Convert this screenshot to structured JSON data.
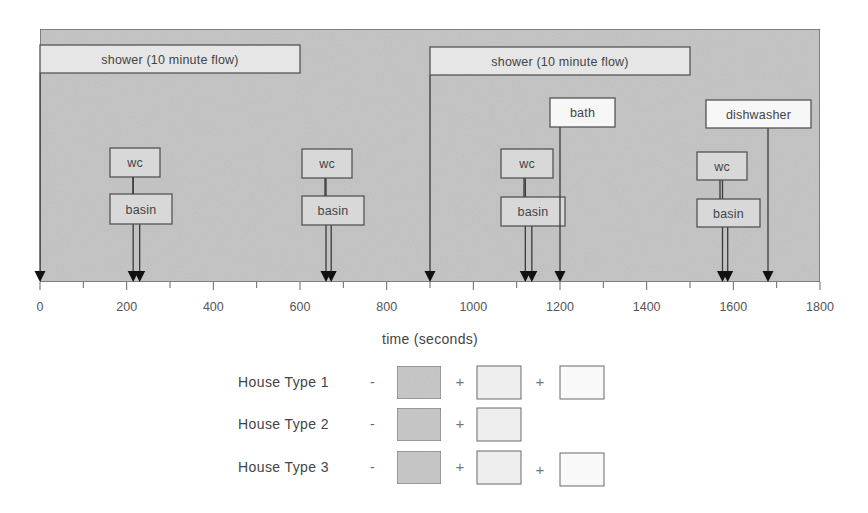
{
  "chart_data": {
    "type": "timeline",
    "title": "",
    "xlabel": "time (seconds)",
    "xlim": [
      0,
      1800
    ],
    "xticks": [
      0,
      200,
      400,
      600,
      800,
      1000,
      1200,
      1400,
      1600,
      1800
    ],
    "minor_tick_step": 100,
    "colors": {
      "panel": "#c6c6c6",
      "shower_box": "#e6e6e6",
      "appliance_box": "#d8d8d8",
      "bath_box": "#f7f7f7",
      "line": "#3a3a3a"
    },
    "events": [
      {
        "label": "shower (10 minute flow)",
        "kind": "shower",
        "start": 0,
        "duration": 600,
        "arrow_at": 0,
        "box": {
          "x1": 0,
          "x2": 600,
          "y": 45,
          "h": 28
        }
      },
      {
        "label": "wc",
        "kind": "wc",
        "arrow_at": 215,
        "group": 1,
        "box": {
          "x": 110,
          "w": 50,
          "y": 148,
          "h": 29
        }
      },
      {
        "label": "basin",
        "kind": "basin",
        "arrow_at": 230,
        "group": 1,
        "box": {
          "x": 110,
          "w": 62,
          "y": 194,
          "h": 30
        }
      },
      {
        "label": "wc",
        "kind": "wc",
        "arrow_at": 660,
        "group": 2,
        "box": {
          "x": 302,
          "w": 50,
          "y": 149,
          "h": 29
        }
      },
      {
        "label": "basin",
        "kind": "basin",
        "arrow_at": 672,
        "group": 2,
        "box": {
          "x": 302,
          "w": 62,
          "y": 196,
          "h": 29
        }
      },
      {
        "label": "shower (10 minute flow)",
        "kind": "shower",
        "start": 900,
        "duration": 600,
        "arrow_at": 900,
        "box": {
          "x1": 900,
          "x2": 1500,
          "y": 47,
          "h": 28
        }
      },
      {
        "label": "wc",
        "kind": "wc",
        "arrow_at": 1120,
        "group": 3,
        "box": {
          "x": 501,
          "w": 52,
          "y": 149,
          "h": 29
        }
      },
      {
        "label": "basin",
        "kind": "basin",
        "arrow_at": 1135,
        "group": 3,
        "box": {
          "x": 501,
          "w": 64,
          "y": 197,
          "h": 29
        }
      },
      {
        "label": "bath",
        "kind": "bath",
        "arrow_at": 1200,
        "box": {
          "x": 550,
          "w": 65,
          "y": 98,
          "h": 29
        }
      },
      {
        "label": "wc",
        "kind": "wc",
        "arrow_at": 1575,
        "group": 4,
        "box": {
          "x": 697,
          "w": 50,
          "y": 152,
          "h": 28
        }
      },
      {
        "label": "basin",
        "kind": "basin",
        "arrow_at": 1587,
        "group": 4,
        "box": {
          "x": 697,
          "w": 63,
          "y": 199,
          "h": 28
        }
      },
      {
        "label": "dishwasher",
        "kind": "dishwasher",
        "arrow_at": 1680,
        "box": {
          "x": 706,
          "w": 105,
          "y": 100,
          "h": 28
        }
      }
    ],
    "legend": {
      "rows": [
        {
          "label": "House Type 1",
          "separator": "-",
          "boxes": [
            "shaded",
            "light",
            "white"
          ],
          "operators": [
            "+",
            "+"
          ]
        },
        {
          "label": "House Type 2",
          "separator": "-",
          "boxes": [
            "shaded",
            "light"
          ],
          "operators": [
            "+"
          ]
        },
        {
          "label": "House Type 3",
          "separator": "-",
          "boxes": [
            "shaded",
            "light",
            "white"
          ],
          "operators": [
            "+",
            "+"
          ]
        }
      ]
    }
  },
  "axis": {
    "xlabel": "time (seconds)",
    "tick_labels": [
      "0",
      "200",
      "400",
      "600",
      "800",
      "1000",
      "1200",
      "1400",
      "1600",
      "1800"
    ]
  },
  "legend": {
    "rows": [
      {
        "label": "House Type 1",
        "dash": "-",
        "plus": [
          "+",
          "+"
        ]
      },
      {
        "label": "House Type 2",
        "dash": "-",
        "plus": [
          "+"
        ]
      },
      {
        "label": "House Type 3",
        "dash": "-",
        "plus": [
          "+",
          "+"
        ]
      }
    ]
  }
}
